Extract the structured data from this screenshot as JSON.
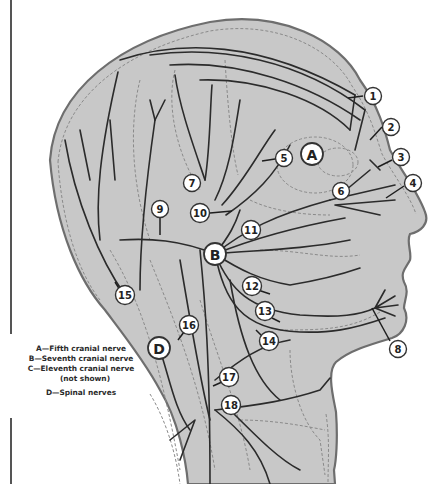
{
  "figure": {
    "colors": {
      "background": "#ffffff",
      "skin_fill": "#c8c8c8",
      "outline": "#6e6e6e",
      "nerve": "#2b2b2b",
      "dashed_guides": "#8a8a8a",
      "callout_fill": "#ffffff"
    }
  },
  "legend": {
    "items": [
      {
        "letter": "A",
        "text": "A—Fifth cranial nerve"
      },
      {
        "letter": "B",
        "text": "B—Seventh cranial nerve"
      },
      {
        "letter": "C",
        "text": "C—Eleventh cranial nerve"
      },
      {
        "letter": "C",
        "text": "(not shown)"
      },
      {
        "letter": "D",
        "text": "D—Spinal nerves"
      }
    ]
  },
  "region_labels": [
    {
      "id": "A",
      "label": "A",
      "x": 312,
      "y": 154
    },
    {
      "id": "B",
      "label": "B",
      "x": 215,
      "y": 254
    },
    {
      "id": "D",
      "label": "D",
      "x": 159,
      "y": 348
    }
  ],
  "callouts": [
    {
      "n": "1",
      "label": "1",
      "x": 373,
      "y": 96
    },
    {
      "n": "2",
      "label": "2",
      "x": 391,
      "y": 127
    },
    {
      "n": "3",
      "label": "3",
      "x": 401,
      "y": 157
    },
    {
      "n": "4",
      "label": "4",
      "x": 413,
      "y": 183
    },
    {
      "n": "5",
      "label": "5",
      "x": 284,
      "y": 158
    },
    {
      "n": "6",
      "label": "6",
      "x": 341,
      "y": 191
    },
    {
      "n": "7",
      "label": "7",
      "x": 192,
      "y": 183
    },
    {
      "n": "8",
      "label": "8",
      "x": 398,
      "y": 349
    },
    {
      "n": "9",
      "label": "9",
      "x": 160,
      "y": 209
    },
    {
      "n": "10",
      "label": "10",
      "x": 200,
      "y": 213
    },
    {
      "n": "11",
      "label": "11",
      "x": 251,
      "y": 230
    },
    {
      "n": "12",
      "label": "12",
      "x": 252,
      "y": 286
    },
    {
      "n": "13",
      "label": "13",
      "x": 265,
      "y": 311
    },
    {
      "n": "14",
      "label": "14",
      "x": 269,
      "y": 341
    },
    {
      "n": "15",
      "label": "15",
      "x": 125,
      "y": 295
    },
    {
      "n": "16",
      "label": "16",
      "x": 189,
      "y": 325
    },
    {
      "n": "17",
      "label": "17",
      "x": 229,
      "y": 377
    },
    {
      "n": "18",
      "label": "18",
      "x": 231,
      "y": 405
    }
  ]
}
